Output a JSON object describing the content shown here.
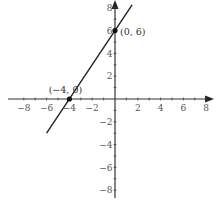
{
  "chart_data": {
    "type": "line",
    "title": "",
    "xlabel": "",
    "ylabel": "",
    "xlim": [
      -9,
      9
    ],
    "ylim": [
      -9,
      9
    ],
    "grid": false,
    "x_ticks": [
      -8,
      -6,
      -4,
      -2,
      2,
      4,
      6,
      8
    ],
    "y_ticks": [
      -8,
      -6,
      -4,
      -2,
      2,
      4,
      6,
      8
    ],
    "x_tick_labels": [
      "−8",
      "−6",
      "−4",
      "−2",
      "2",
      "4",
      "6",
      "8"
    ],
    "y_tick_labels": [
      "−8",
      "−6",
      "−4",
      "−2",
      "2",
      "4",
      "6",
      "8"
    ],
    "series": [
      {
        "name": "y = 1.5x + 6",
        "slope": 1.5,
        "intercept": 6,
        "x": [
          -6,
          1.5
        ],
        "y": [
          -3,
          8.25
        ],
        "color": "#222222"
      }
    ],
    "annotations": [
      {
        "label": "(0, 6)",
        "x": 0,
        "y": 6,
        "marker": true
      },
      {
        "label": "(−4, 0)",
        "x": -4,
        "y": 0,
        "marker": true
      }
    ]
  }
}
